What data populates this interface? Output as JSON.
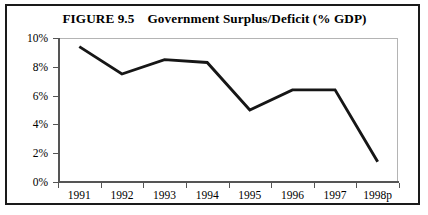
{
  "figure": {
    "title_number": "FIGURE 9.5",
    "title_text": "Government Surplus/Deficit (% GDP)",
    "frame_color": "#1a1a1a",
    "line_color": "#161616",
    "axis_color": "#555555",
    "plot_box_color": "#b4b4b4"
  },
  "chart_data": {
    "type": "line",
    "xlabel": "",
    "ylabel": "",
    "categories": [
      "1991",
      "1992",
      "1993",
      "1994",
      "1995",
      "1996",
      "1997",
      "1998p"
    ],
    "values": [
      9.4,
      7.5,
      8.5,
      8.3,
      5.0,
      6.4,
      6.4,
      1.4
    ],
    "series": [
      {
        "name": "Government Surplus/Deficit (% GDP)",
        "values": [
          9.4,
          7.5,
          8.5,
          8.3,
          5.0,
          6.4,
          6.4,
          1.4
        ]
      }
    ],
    "ylim": [
      0,
      10
    ],
    "ytick_values": [
      0,
      2,
      4,
      6,
      8,
      10
    ],
    "ytick_labels": [
      "0%",
      "2%",
      "4%",
      "6%",
      "8%",
      "10%"
    ],
    "grid": false,
    "legend": "none",
    "units": "percent of GDP"
  }
}
